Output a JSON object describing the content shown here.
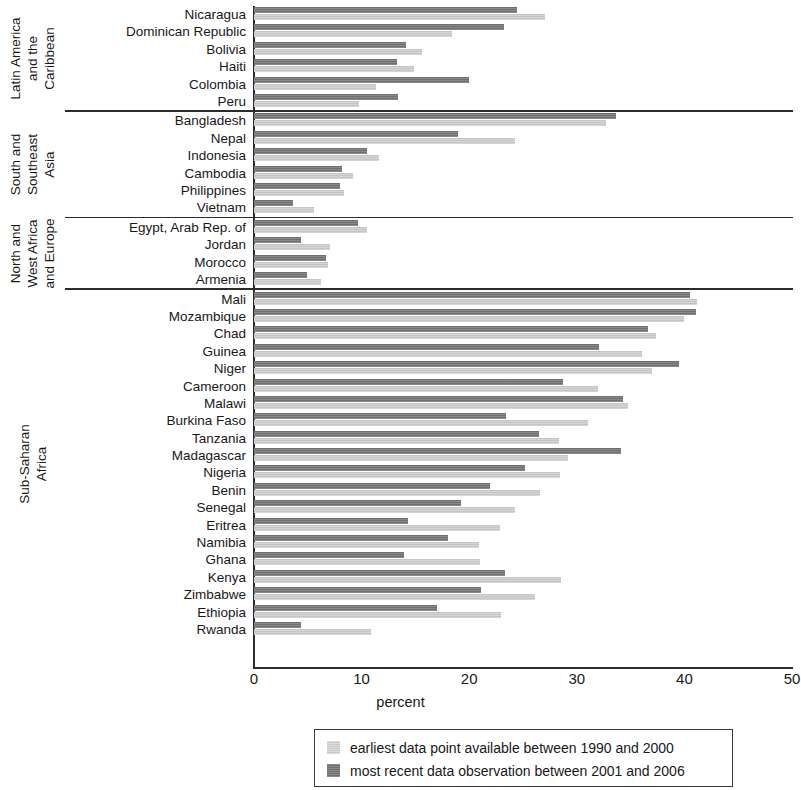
{
  "chart_data": {
    "type": "bar",
    "orientation": "horizontal",
    "title": "",
    "xlabel": "percent",
    "ylabel": "",
    "xlim": [
      0,
      50
    ],
    "xticks": [
      "0",
      "10",
      "20",
      "30",
      "40",
      "50"
    ],
    "grid": false,
    "legend_position": "bottom",
    "series": [
      {
        "name": "earliest data point available between 1990 and 2000",
        "key": "earliest",
        "color": "#c4c4c4"
      },
      {
        "name": "most recent data observation between 2001 and 2006",
        "key": "recent",
        "color": "#6f6f6f"
      }
    ],
    "groups": [
      {
        "label": "Latin America\nand the\nCaribbean",
        "label_lines": [
          "Latin America",
          "and the",
          "Caribbean"
        ],
        "categories": [
          {
            "name": "Nicaragua",
            "earliest": 27.0,
            "recent": 24.4
          },
          {
            "name": "Dominican Republic",
            "earliest": 18.4,
            "recent": 23.2
          },
          {
            "name": "Bolivia",
            "earliest": 15.6,
            "recent": 14.1
          },
          {
            "name": "Haiti",
            "earliest": 14.9,
            "recent": 13.3
          },
          {
            "name": "Colombia",
            "earliest": 11.3,
            "recent": 20.0
          },
          {
            "name": "Peru",
            "earliest": 9.8,
            "recent": 13.4
          }
        ]
      },
      {
        "label": "South and\nSoutheast\nAsia",
        "label_lines": [
          "South and",
          "Southeast",
          "Asia"
        ],
        "categories": [
          {
            "name": "Bangladesh",
            "earliest": 32.7,
            "recent": 33.6
          },
          {
            "name": "Nepal",
            "earliest": 24.3,
            "recent": 19.0
          },
          {
            "name": "Indonesia",
            "earliest": 11.6,
            "recent": 10.5
          },
          {
            "name": "Cambodia",
            "earliest": 9.2,
            "recent": 8.2
          },
          {
            "name": "Philippines",
            "earliest": 8.4,
            "recent": 8.0
          },
          {
            "name": "Vietnam",
            "earliest": 5.6,
            "recent": 3.6
          }
        ]
      },
      {
        "label": "North and\nWest Africa\nand Europe",
        "label_lines": [
          "North and",
          "West Africa",
          "and Europe"
        ],
        "categories": [
          {
            "name": "Egypt, Arab Rep. of",
            "earliest": 10.5,
            "recent": 9.7
          },
          {
            "name": "Jordan",
            "earliest": 7.1,
            "recent": 4.4
          },
          {
            "name": "Morocco",
            "earliest": 6.9,
            "recent": 6.7
          },
          {
            "name": "Armenia",
            "earliest": 6.2,
            "recent": 4.9
          }
        ]
      },
      {
        "label": "Sub-Saharan\nAfrica",
        "label_lines": [
          "Sub-Saharan",
          "Africa"
        ],
        "categories": [
          {
            "name": "Mali",
            "earliest": 41.2,
            "recent": 40.5
          },
          {
            "name": "Mozambique",
            "earliest": 40.0,
            "recent": 41.1
          },
          {
            "name": "Chad",
            "earliest": 37.4,
            "recent": 36.6
          },
          {
            "name": "Guinea",
            "earliest": 36.1,
            "recent": 32.1
          },
          {
            "name": "Niger",
            "earliest": 37.0,
            "recent": 39.5
          },
          {
            "name": "Cameroon",
            "earliest": 32.0,
            "recent": 28.7
          },
          {
            "name": "Malawi",
            "earliest": 34.8,
            "recent": 34.3
          },
          {
            "name": "Burkina Faso",
            "earliest": 31.0,
            "recent": 23.4
          },
          {
            "name": "Tanzania",
            "earliest": 28.3,
            "recent": 26.5
          },
          {
            "name": "Madagascar",
            "earliest": 29.2,
            "recent": 34.1
          },
          {
            "name": "Nigeria",
            "earliest": 28.4,
            "recent": 25.2
          },
          {
            "name": "Benin",
            "earliest": 26.6,
            "recent": 21.9
          },
          {
            "name": "Senegal",
            "earliest": 24.3,
            "recent": 19.2
          },
          {
            "name": "Eritrea",
            "earliest": 22.9,
            "recent": 14.3
          },
          {
            "name": "Namibia",
            "earliest": 20.9,
            "recent": 18.0
          },
          {
            "name": "Ghana",
            "earliest": 21.0,
            "recent": 13.9
          },
          {
            "name": "Kenya",
            "earliest": 28.5,
            "recent": 23.3
          },
          {
            "name": "Zimbabwe",
            "earliest": 26.1,
            "recent": 21.1
          },
          {
            "name": "Ethiopia",
            "earliest": 23.0,
            "recent": 17.0
          },
          {
            "name": "Rwanda",
            "earliest": 10.9,
            "recent": 4.4
          }
        ]
      }
    ]
  },
  "legend": {
    "items": [
      {
        "label": "earliest data point available between 1990 and 2000",
        "key": "earliest"
      },
      {
        "label": "most recent data observation between 2001 and 2006",
        "key": "recent"
      }
    ]
  },
  "axis": {
    "x_label": "percent",
    "x_ticks": [
      "0",
      "10",
      "20",
      "30",
      "40",
      "50"
    ]
  }
}
